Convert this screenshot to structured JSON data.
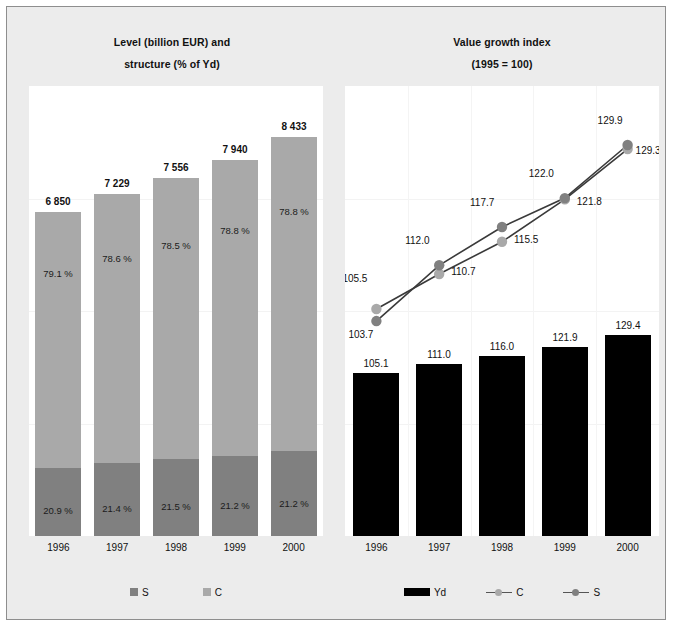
{
  "colors": {
    "frame_border": "#8e8e8e",
    "panel_bg": "#ececec",
    "plot_bg": "#ffffff",
    "series_s": "#808080",
    "series_c": "#a9a9a9",
    "series_yd": "#000000"
  },
  "left_panel": {
    "title_line1": "Level (billion EUR) and",
    "title_line2": "structure (% of Yd)",
    "legend": [
      {
        "label": "S",
        "swatch": "square-swatch",
        "color": "#808080"
      },
      {
        "label": "C",
        "swatch": "square-swatch",
        "color": "#a9a9a9"
      }
    ]
  },
  "right_panel": {
    "title_line1": "Value growth index",
    "title_line2": "(1995 = 100)",
    "legend": [
      {
        "label": "Yd",
        "swatch": "bar-swatch",
        "color": "#000000"
      },
      {
        "label": "C",
        "swatch": "line-swatch",
        "color": "#a9a9a9"
      },
      {
        "label": "S",
        "swatch": "line-swatch",
        "color": "#808080"
      }
    ]
  },
  "chart_data": [
    {
      "type": "bar",
      "id": "level-and-structure",
      "title": "Level (billion EUR) and structure (% of Yd)",
      "xlabel": "",
      "ylabel": "",
      "stacked": true,
      "grid": false,
      "legend_position": "bottom",
      "ylim": [
        0,
        9500
      ],
      "categories": [
        "1996",
        "1997",
        "1998",
        "1999",
        "2000"
      ],
      "totals": [
        "6 850",
        "7 229",
        "7 556",
        "7 940",
        "8 433"
      ],
      "totals_numeric": [
        6850,
        7229,
        7556,
        7940,
        8433
      ],
      "series": [
        {
          "name": "S",
          "color": "#808080",
          "share_labels": [
            "20.9 %",
            "21.4 %",
            "21.5 %",
            "21.2 %",
            "21.2 %"
          ],
          "shares": [
            20.9,
            21.4,
            21.5,
            21.2,
            21.2
          ]
        },
        {
          "name": "C",
          "color": "#a9a9a9",
          "share_labels": [
            "79.1 %",
            "78.6 %",
            "78.5 %",
            "78.8 %",
            "78.8 %"
          ],
          "shares": [
            79.1,
            78.6,
            78.5,
            78.8,
            78.8
          ]
        }
      ]
    },
    {
      "type": "bar",
      "id": "value-growth-index-bars",
      "title": "Value growth index (1995 = 100)",
      "xlabel": "",
      "ylabel": "",
      "grid": false,
      "legend_position": "bottom",
      "ylim": [
        0,
        140
      ],
      "categories": [
        "1996",
        "1997",
        "1998",
        "1999",
        "2000"
      ],
      "series": [
        {
          "name": "Yd",
          "color": "#000000",
          "values": [
            105.1,
            111.0,
            116.0,
            121.9,
            129.4
          ],
          "labels": [
            "105.1",
            "111.0",
            "116.0",
            "121.9",
            "129.4"
          ]
        }
      ]
    },
    {
      "type": "line",
      "id": "value-growth-index-lines",
      "title": "Value growth index (1995 = 100)",
      "xlabel": "",
      "ylabel": "",
      "grid": false,
      "legend_position": "bottom",
      "ylim": [
        100,
        132
      ],
      "x": [
        "1996",
        "1997",
        "1998",
        "1999",
        "2000"
      ],
      "series": [
        {
          "name": "C",
          "color": "#a9a9a9",
          "values": [
            105.5,
            110.7,
            115.5,
            121.8,
            129.3
          ],
          "labels": [
            "105.5",
            "110.7",
            "115.5",
            "121.8",
            "129.3"
          ]
        },
        {
          "name": "S",
          "color": "#808080",
          "values": [
            103.7,
            112.0,
            117.7,
            122.0,
            129.9
          ],
          "labels": [
            "103.7",
            "112.0",
            "117.7",
            "122.0",
            "129.9"
          ]
        }
      ]
    }
  ],
  "axis": {
    "left_ticks": [
      "1996",
      "1997",
      "1998",
      "1999",
      "2000"
    ],
    "right_ticks": [
      "1996",
      "1997",
      "1998",
      "1999",
      "2000"
    ]
  }
}
